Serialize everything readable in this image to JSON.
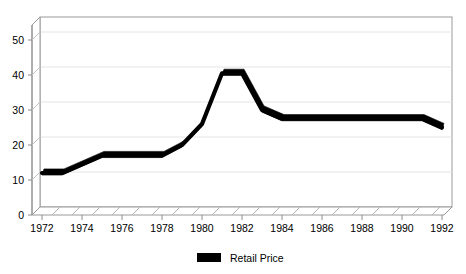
{
  "chart_data": {
    "type": "line",
    "title": "",
    "subtitle": "",
    "xlabel": "",
    "ylabel": "",
    "xlim": [
      1972,
      1992
    ],
    "ylim": [
      0,
      50
    ],
    "grid": true,
    "legend_position": "bottom-center",
    "style": "3d-ribbon-line",
    "x": [
      1972,
      1973,
      1974,
      1975,
      1976,
      1977,
      1978,
      1979,
      1980,
      1981,
      1982,
      1983,
      1984,
      1985,
      1986,
      1987,
      1988,
      1989,
      1990,
      1991,
      1992
    ],
    "series": [
      {
        "name": "Retail Price",
        "color": "#000000",
        "values": [
          12.0,
          12.0,
          14.5,
          17.0,
          17.0,
          17.0,
          17.0,
          20.0,
          26.0,
          40.5,
          40.5,
          30.0,
          27.5,
          27.5,
          27.5,
          27.5,
          27.5,
          27.5,
          27.5,
          27.5,
          25.0
        ]
      }
    ],
    "x_tick_values": [
      1972,
      1974,
      1976,
      1978,
      1980,
      1982,
      1984,
      1986,
      1988,
      1990,
      1992
    ],
    "x_tick_labels": [
      "1972",
      "1974",
      "1976",
      "1978",
      "1980",
      "1982",
      "1984",
      "1986",
      "1988",
      "1990",
      "1992"
    ],
    "y_tick_values": [
      0,
      10,
      20,
      30,
      40,
      50
    ],
    "y_tick_labels": [
      "0",
      "10",
      "20",
      "30",
      "40",
      "50"
    ],
    "legend": [
      {
        "label": "Retail Price",
        "swatch_color": "#000000",
        "swatch_name": "legend-swatch-retail-price"
      }
    ],
    "colors": {
      "background": "#ffffff",
      "axis": "#9a9a9a",
      "grid": "#e2e2e2",
      "series": "#000000",
      "floor_hatch": "#b0b0b0"
    }
  }
}
